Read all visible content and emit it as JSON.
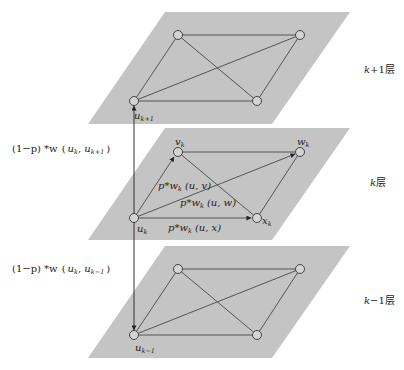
{
  "diagram": {
    "colors": {
      "plane": "#c4c4c4",
      "edge": "#555555",
      "node_fill": "#d4d4d4",
      "node_stroke": "#444444",
      "background": "#ffffff"
    },
    "layers": [
      {
        "id": "upper",
        "label": "k+1层",
        "label_italic": "k",
        "label_rest": "+1层",
        "nodes": [
          {
            "id": "a",
            "label": "",
            "x": 178,
            "y": 35
          },
          {
            "id": "b",
            "label": "",
            "x": 300,
            "y": 35
          },
          {
            "id": "u",
            "label": "u",
            "sub": "k+1",
            "x": 134,
            "y": 101
          },
          {
            "id": "c",
            "label": "",
            "x": 257,
            "y": 101
          }
        ]
      },
      {
        "id": "middle",
        "label": "k层",
        "label_italic": "k",
        "label_rest": "层",
        "nodes": [
          {
            "id": "v",
            "label": "v",
            "sub": "k",
            "x": 178,
            "y": 152
          },
          {
            "id": "w",
            "label": "w",
            "sub": "k",
            "x": 300,
            "y": 152
          },
          {
            "id": "u",
            "label": "u",
            "sub": "k",
            "x": 134,
            "y": 218
          },
          {
            "id": "x",
            "label": "x",
            "sub": "k",
            "x": 257,
            "y": 218
          }
        ],
        "edge_labels": [
          {
            "text": "p*w",
            "sub": "k",
            "args": "(u, v)"
          },
          {
            "text": "p*w",
            "sub": "k",
            "args": "(u, w)"
          },
          {
            "text": "p*w",
            "sub": "k",
            "args": "(u, x)"
          }
        ]
      },
      {
        "id": "lower",
        "label": "k−1层",
        "label_italic": "k",
        "label_rest": "−1层",
        "nodes": [
          {
            "id": "a",
            "label": "",
            "x": 178,
            "y": 269
          },
          {
            "id": "b",
            "label": "",
            "x": 300,
            "y": 269
          },
          {
            "id": "u",
            "label": "u",
            "sub": "k−1",
            "x": 134,
            "y": 335
          },
          {
            "id": "c",
            "label": "",
            "x": 257,
            "y": 335
          }
        ]
      }
    ],
    "interlayer_labels": [
      {
        "prefix": "(1−p) *w",
        "args_open": "(",
        "a": "u",
        "a_sub": "k",
        "b": "u",
        "b_sub": "k+1",
        "args_close": ")"
      },
      {
        "prefix": "(1−p) *w",
        "args_open": "(",
        "a": "u",
        "a_sub": "k",
        "b": "u",
        "b_sub": "k−1",
        "args_close": ")"
      }
    ]
  }
}
